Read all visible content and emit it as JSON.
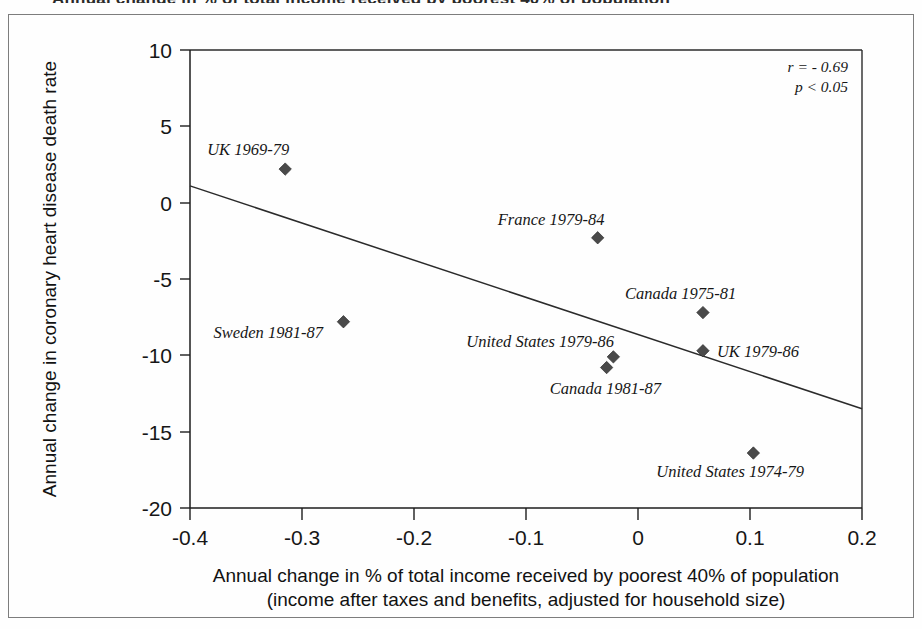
{
  "figure": {
    "top_cut_text": "Annual change in % of total income received by poorest 40% of population"
  },
  "chart_data": {
    "type": "scatter",
    "title": "",
    "xlabel_line1": "Annual change in % of total income received by poorest 40% of population",
    "xlabel_line2": "(income after taxes and benefits, adjusted for household size)",
    "ylabel": "Annual change in coronary heart disease death rate",
    "xlim": [
      -0.4,
      0.2
    ],
    "ylim": [
      -20,
      10
    ],
    "xticks": [
      -0.4,
      -0.3,
      -0.2,
      -0.1,
      0,
      0.1,
      0.2
    ],
    "xtick_labels": [
      "-0.4",
      "-0.3",
      "-0.2",
      "-0.1",
      "0",
      "0.1",
      "0.2"
    ],
    "yticks": [
      10,
      5,
      0,
      -5,
      -10,
      -15,
      -20
    ],
    "ytick_labels": [
      "10",
      "5",
      "0",
      "-5",
      "-10",
      "-15",
      "-20"
    ],
    "grid": false,
    "legend": "none",
    "marker_shape": "diamond",
    "marker_color": "#4a4a4a",
    "points": [
      {
        "label": "UK 1969-79",
        "x": -0.315,
        "y": 2.2,
        "label_dx": -78,
        "label_dy": -14,
        "label_anchor": "start"
      },
      {
        "label": "Sweden 1981-87",
        "x": -0.263,
        "y": -7.8,
        "label_dx": -130,
        "label_dy": 16,
        "label_anchor": "start"
      },
      {
        "label": "France 1979-84",
        "x": -0.036,
        "y": -2.3,
        "label_dx": -100,
        "label_dy": -13,
        "label_anchor": "start"
      },
      {
        "label": "United States 1979-86",
        "x": -0.022,
        "y": -10.1,
        "label_dx": -147,
        "label_dy": -10,
        "label_anchor": "start"
      },
      {
        "label": "Canada 1981-87",
        "x": -0.028,
        "y": -10.8,
        "label_dx": -57,
        "label_dy": 26,
        "label_anchor": "start"
      },
      {
        "label": "Canada 1975-81",
        "x": 0.058,
        "y": -7.2,
        "label_dx": -78,
        "label_dy": -14,
        "label_anchor": "start"
      },
      {
        "label": "UK 1979-86",
        "x": 0.058,
        "y": -9.7,
        "label_dx": 14,
        "label_dy": 6,
        "label_anchor": "start"
      },
      {
        "label": "United States 1974-79",
        "x": 0.103,
        "y": -16.4,
        "label_dx": -97,
        "label_dy": 24,
        "label_anchor": "start"
      }
    ],
    "trend_line": {
      "x_start": -0.4,
      "y_start": 1.1,
      "x_end": 0.2,
      "y_end": -13.5
    },
    "annotations": {
      "r_value": "r = - 0.69",
      "p_value": "p < 0.05"
    }
  }
}
